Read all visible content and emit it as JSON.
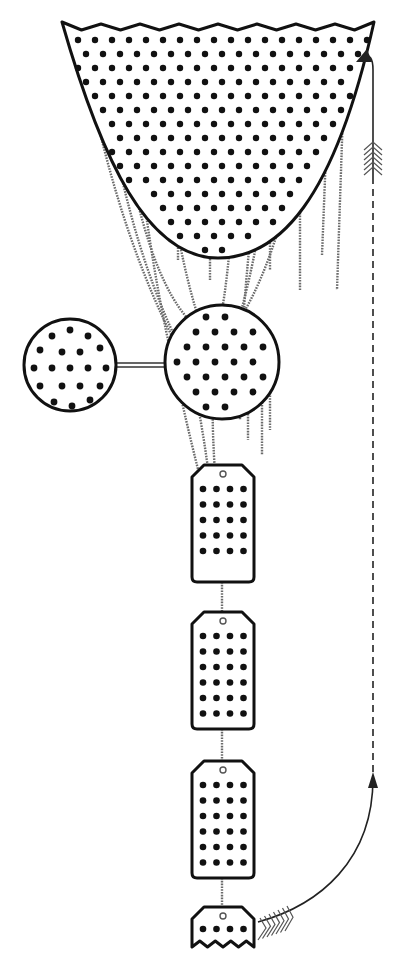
{
  "diagram": {
    "colors": {
      "outline": "#111111",
      "strand": "#6b6b6b",
      "background": "#ffffff"
    },
    "funnel": {
      "top_y": 22,
      "left_x": 62,
      "right_x": 374,
      "bottom_y": 258,
      "bottom_x": 218
    },
    "side_circle": {
      "cx": 70,
      "cy": 365,
      "r": 46
    },
    "main_circle": {
      "cx": 222,
      "cy": 362,
      "r": 57
    },
    "tags": [
      {
        "x": 192,
        "y": 465,
        "w": 62,
        "h": 117,
        "rows": 5,
        "cols": 4
      },
      {
        "x": 192,
        "y": 612,
        "w": 62,
        "h": 117,
        "rows": 6,
        "cols": 4
      },
      {
        "x": 192,
        "y": 761,
        "w": 62,
        "h": 117,
        "rows": 6,
        "cols": 4
      },
      {
        "x": 192,
        "y": 907,
        "w": 62,
        "h": 40,
        "rows": 1,
        "cols": 4,
        "torn": true
      }
    ],
    "return_arrow": {
      "dashed_x": 373,
      "dashed_top": 180,
      "dashed_bottom": 778,
      "curve_start": [
        258,
        922
      ],
      "arrow_tip_top": [
        373,
        45
      ]
    }
  }
}
